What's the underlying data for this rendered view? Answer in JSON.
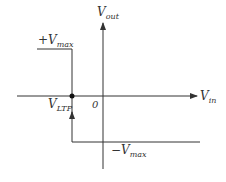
{
  "diagram": {
    "axes": {
      "y_label_main": "V",
      "y_label_sub": "out",
      "x_label_main": "V",
      "x_label_sub": "in",
      "origin_label": "0"
    },
    "levels": {
      "positive_sign": "+",
      "positive_main": "V",
      "positive_sub": "max",
      "negative_sign": "−",
      "negative_main": "V",
      "negative_sub": "max"
    },
    "threshold": {
      "main": "V",
      "sub": "LTP"
    },
    "colors": {
      "line": "#333333",
      "background": "#ffffff"
    }
  }
}
